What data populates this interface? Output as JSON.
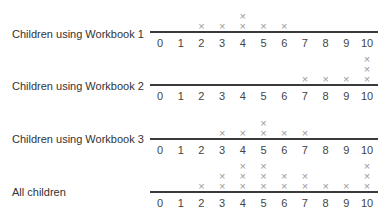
{
  "chart_data": {
    "type": "dot",
    "title": "",
    "xlabel": "",
    "ylabel": "",
    "x_ticks": [
      0,
      1,
      2,
      3,
      4,
      5,
      6,
      7,
      8,
      9,
      10
    ],
    "xlim": [
      0,
      10
    ],
    "mark_symbol": "X",
    "series": [
      {
        "name": "Children using Workbook 1",
        "counts": {
          "0": 0,
          "1": 0,
          "2": 1,
          "3": 1,
          "4": 2,
          "5": 1,
          "6": 1,
          "7": 0,
          "8": 0,
          "9": 0,
          "10": 0
        }
      },
      {
        "name": "Children using Workbook 2",
        "counts": {
          "0": 0,
          "1": 0,
          "2": 0,
          "3": 0,
          "4": 0,
          "5": 0,
          "6": 0,
          "7": 1,
          "8": 1,
          "9": 1,
          "10": 3
        }
      },
      {
        "name": "Children using Workbook 3",
        "counts": {
          "0": 0,
          "1": 0,
          "2": 0,
          "3": 1,
          "4": 1,
          "5": 2,
          "6": 1,
          "7": 1,
          "8": 0,
          "9": 0,
          "10": 0
        }
      },
      {
        "name": "All children",
        "counts": {
          "0": 0,
          "1": 0,
          "2": 1,
          "3": 2,
          "4": 3,
          "5": 3,
          "6": 2,
          "7": 2,
          "8": 1,
          "9": 1,
          "10": 3
        }
      }
    ]
  },
  "rows": [
    {
      "label": "Children using Workbook 1"
    },
    {
      "label": "Children using Workbook 2"
    },
    {
      "label": "Children using Workbook 3"
    },
    {
      "label": "All children"
    }
  ],
  "colors": {
    "axis": "#3a3a3a",
    "mark": "#9a9a9a",
    "text": "#333333"
  }
}
